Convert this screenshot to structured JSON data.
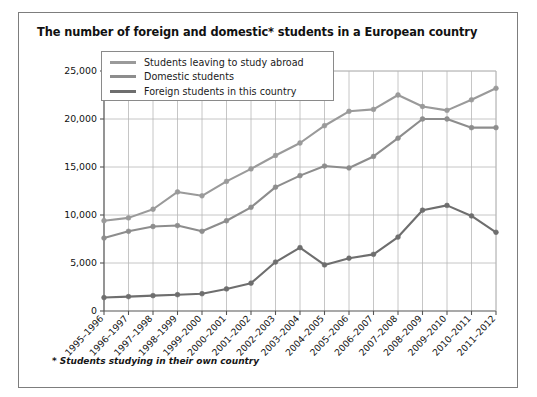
{
  "clipped_header_text": "",
  "chart_title": "The number of foreign and domestic* students in a European country",
  "footnote": {
    "marker": "*",
    "text": "Students studying in their own country"
  },
  "legend": {
    "position": "top-left-inside",
    "entries": [
      {
        "label": "Students leaving to study abroad",
        "color": "#9a9a9a"
      },
      {
        "label": "Domestic students",
        "color": "#8d8d8d"
      },
      {
        "label": "Foreign students in this country",
        "color": "#6e6e6e"
      }
    ]
  },
  "axes": {
    "y_ticks": [
      "0",
      "5,000",
      "10,000",
      "15,000",
      "20,000",
      "25,000"
    ],
    "x_ticks": [
      "1995–1996",
      "1996–1997",
      "1997–1998",
      "1998–1999",
      "1999–2000",
      "2000–2001",
      "2001–2002",
      "2002–2003",
      "2003–2004",
      "2004–2005",
      "2005–2006",
      "2006–2007",
      "2007–2008",
      "2008–2009",
      "2009–2010",
      "2010–2011",
      "2011–2012"
    ]
  },
  "colors": {
    "frame": "#7d7d7d",
    "grid": "#b8b8b8",
    "axis": "#555555",
    "text": "#111111",
    "plot_background": "#ffffff"
  },
  "chart_data": {
    "type": "line",
    "title": "The number of foreign and domestic* students in a European country",
    "xlabel": "",
    "ylabel": "",
    "ylim": [
      0,
      25000
    ],
    "ytick_step": 5000,
    "grid": true,
    "legend_position": "upper left",
    "categories": [
      "1995–1996",
      "1996–1997",
      "1997–1998",
      "1998–1999",
      "1999–2000",
      "2000–2001",
      "2001–2002",
      "2002–2003",
      "2003–2004",
      "2004–2005",
      "2005–2006",
      "2006–2007",
      "2007–2008",
      "2008–2009",
      "2009–2010",
      "2010–2011",
      "2011–2012"
    ],
    "series": [
      {
        "name": "Students leaving to study abroad",
        "color": "#9a9a9a",
        "values": [
          9400,
          9700,
          10600,
          12400,
          12000,
          13500,
          14800,
          16200,
          17500,
          19300,
          20800,
          21000,
          22500,
          21300,
          20900,
          22000,
          23200
        ]
      },
      {
        "name": "Domestic students",
        "color": "#8d8d8d",
        "values": [
          7600,
          8300,
          8800,
          8900,
          8300,
          9400,
          10800,
          12900,
          14100,
          15100,
          14900,
          16100,
          18000,
          20000,
          20000,
          19100,
          19100
        ]
      },
      {
        "name": "Foreign students in this country",
        "color": "#6e6e6e",
        "values": [
          1400,
          1500,
          1600,
          1700,
          1800,
          2300,
          2900,
          5100,
          6600,
          4800,
          5500,
          5900,
          7700,
          10500,
          11000,
          9900,
          8200
        ]
      }
    ]
  }
}
